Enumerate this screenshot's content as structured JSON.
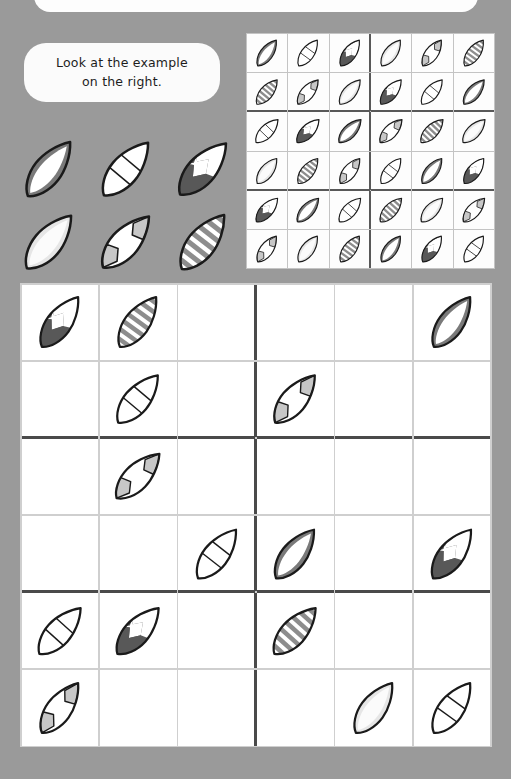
{
  "page": {
    "background_color": "#9a9a9a",
    "panel_color": "#ffffff",
    "grid_line_color": "#4a4a4a"
  },
  "instruction": {
    "text": "Look at the example\non the right.",
    "line1": "Look at the example",
    "line2": "on the right."
  },
  "board_types": [
    {
      "id": "dark",
      "name": "dark-solid-board",
      "label": "Dark solid board",
      "fill": "#7a7a7a",
      "accent": "#6f6f6f"
    },
    {
      "id": "bands",
      "name": "banded-board",
      "label": "White board with bands",
      "fill": "#fbfbfb",
      "accent": "#f2f2f2"
    },
    {
      "id": "chevron",
      "name": "chevron-board",
      "label": "Dark chevron board",
      "fill": "#5a5a5a",
      "accent": "#ffffff"
    },
    {
      "id": "light",
      "name": "light-solid-board",
      "label": "Light solid board",
      "fill": "#e3e3e3",
      "accent": "#f7f7f7"
    },
    {
      "id": "graypatch",
      "name": "gray-patch-board",
      "label": "Gray nose/tail board",
      "fill": "#ffffff",
      "accent": "#c9c9c9"
    },
    {
      "id": "stripes",
      "name": "striped-board",
      "label": "Striped board",
      "fill": "#ffffff",
      "accent": "#8a8a8a"
    }
  ],
  "legend": {
    "name": "board-type-key",
    "rows": [
      [
        "dark",
        "bands",
        "chevron"
      ],
      [
        "light",
        "graypatch",
        "stripes"
      ]
    ]
  },
  "example_grid": {
    "name": "example-solved-grid",
    "size": 6,
    "block_cols": 3,
    "block_rows": 2,
    "rows": [
      [
        "dark",
        "bands",
        "chevron",
        "light",
        "graypatch",
        "stripes"
      ],
      [
        "stripes",
        "graypatch",
        "light",
        "chevron",
        "bands",
        "dark"
      ],
      [
        "bands",
        "chevron",
        "dark",
        "graypatch",
        "stripes",
        "light"
      ],
      [
        "light",
        "stripes",
        "graypatch",
        "bands",
        "dark",
        "chevron"
      ],
      [
        "chevron",
        "dark",
        "bands",
        "stripes",
        "light",
        "graypatch"
      ],
      [
        "graypatch",
        "light",
        "stripes",
        "dark",
        "chevron",
        "bands"
      ]
    ]
  },
  "puzzle_grid": {
    "name": "puzzle-grid",
    "size": 6,
    "block_cols": 3,
    "block_rows": 2,
    "rows": [
      [
        "chevron",
        "stripes",
        "",
        "",
        "",
        "dark"
      ],
      [
        "",
        "bands",
        "",
        "graypatch",
        "",
        ""
      ],
      [
        "",
        "graypatch",
        "",
        "",
        "",
        ""
      ],
      [
        "",
        "",
        "bands",
        "dark",
        "",
        "chevron"
      ],
      [
        "bands",
        "chevron",
        "",
        "stripes",
        "",
        ""
      ],
      [
        "graypatch",
        "",
        "",
        "",
        "light",
        "bands"
      ]
    ]
  }
}
